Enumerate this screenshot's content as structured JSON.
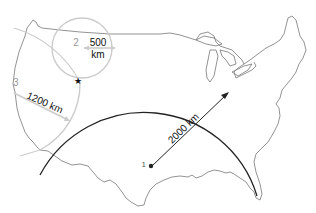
{
  "diagram": {
    "type": "epicenter-triangulation-map",
    "colors": {
      "outline": "#777777",
      "primary_circle": "#222222",
      "secondary_circle": "#bbbbbb",
      "background": "#ffffff"
    },
    "stations": [
      {
        "id": "1",
        "label": "1",
        "distance_label": "2000 km",
        "distance_km": 2000
      },
      {
        "id": "2",
        "label": "2",
        "distance_label_line1": "500",
        "distance_label_line2": "km",
        "distance_km": 500
      },
      {
        "id": "3",
        "label": "3",
        "distance_label": "1200 km",
        "distance_km": 1200
      }
    ],
    "epicenter_marker": "star-icon"
  }
}
